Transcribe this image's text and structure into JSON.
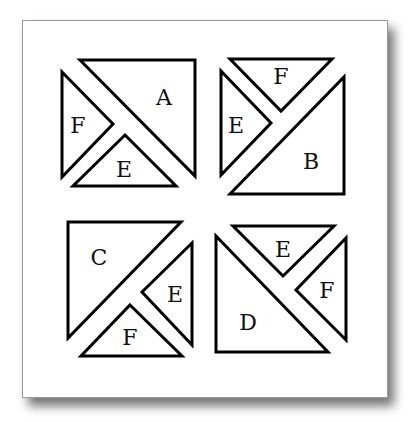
{
  "figure": {
    "background": "#ffffff",
    "stroke_color": "#000000",
    "panels": [
      {
        "name": "top-left",
        "pieces": [
          {
            "label": "A",
            "points": "80,60 195,60 195,176",
            "label_pos": [
              164,
              97
            ]
          },
          {
            "label": "F",
            "points": "62,72 113,124 62,177",
            "label_pos": [
              78,
              125
            ]
          },
          {
            "label": "E",
            "points": "125,135 176,186 73,186",
            "label_pos": [
              124,
              169
            ]
          }
        ]
      },
      {
        "name": "top-right",
        "pieces": [
          {
            "label": "F",
            "points": "230,59 332,59 281,111",
            "label_pos": [
              281,
              76
            ]
          },
          {
            "label": "E",
            "points": "221,71 271,123 221,175",
            "label_pos": [
              236,
              125
            ]
          },
          {
            "label": "B",
            "points": "344,77 344,194 230,194",
            "label_pos": [
              311,
              161
            ]
          }
        ]
      },
      {
        "name": "bottom-left",
        "pieces": [
          {
            "label": "C",
            "points": "68,222 181,222 68,338",
            "label_pos": [
              99,
              257
            ]
          },
          {
            "label": "E",
            "points": "192,243 192,345 142,292",
            "label_pos": [
              175,
              294
            ]
          },
          {
            "label": "F",
            "points": "130,305 182,356 81,356",
            "label_pos": [
              130,
              337
            ]
          }
        ]
      },
      {
        "name": "bottom-right",
        "pieces": [
          {
            "label": "E",
            "points": "233,226 334,226 283,276",
            "label_pos": [
              283,
              249
            ]
          },
          {
            "label": "F",
            "points": "346,238 346,340 296,290",
            "label_pos": [
              327,
              290
            ]
          },
          {
            "label": "D",
            "points": "216,236 328,352 216,352",
            "label_pos": [
              248,
              322
            ]
          }
        ]
      }
    ]
  }
}
